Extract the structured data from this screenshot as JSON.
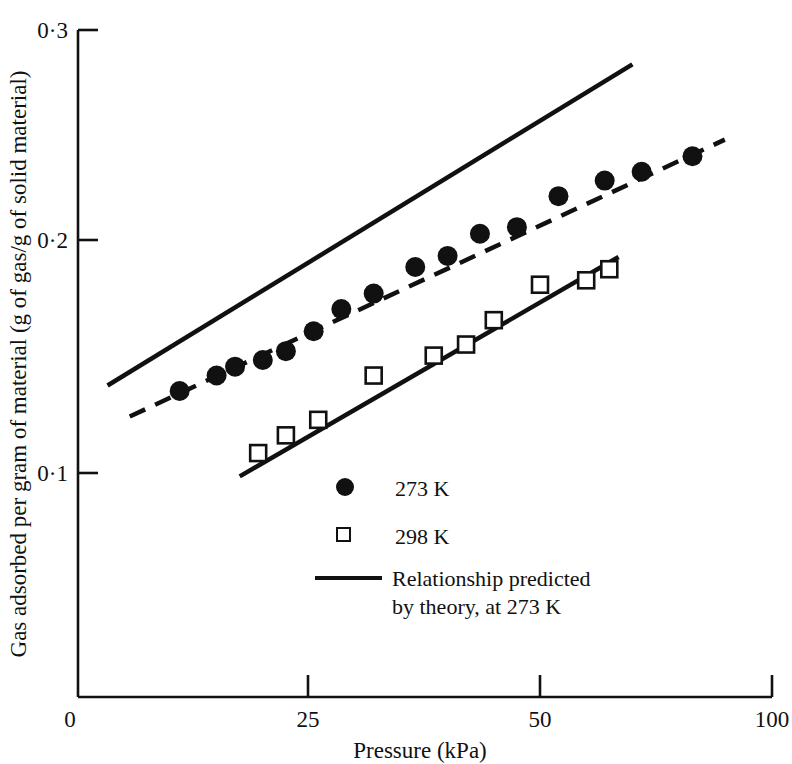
{
  "chart_data": {
    "type": "scatter",
    "title": "",
    "xlabel": "Pressure (kPa)",
    "ylabel": "Gas adsorbed per gram of material  (g of gas/g of solid material)",
    "xlim": [
      0,
      100
    ],
    "ylim": [
      0,
      0.3
    ],
    "xticks": [
      0,
      25,
      50,
      100
    ],
    "xtick_labels": [
      "0",
      "25",
      "50",
      "100"
    ],
    "yticks": [
      0.1,
      0.2,
      0.3
    ],
    "ytick_labels": [
      "0·1",
      "0·2",
      "0·3"
    ],
    "grid": false,
    "legend_position": "center",
    "note_axis": "x axis drawn with compressed final segment between 50 and 100",
    "series": [
      {
        "name": "273 K",
        "marker": "filled-circle",
        "line": "dashed",
        "color": "#111111",
        "points": [
          {
            "x": 11.0,
            "y": 0.137
          },
          {
            "x": 15.0,
            "y": 0.144
          },
          {
            "x": 17.0,
            "y": 0.148
          },
          {
            "x": 20.0,
            "y": 0.151
          },
          {
            "x": 22.5,
            "y": 0.155
          },
          {
            "x": 25.5,
            "y": 0.164
          },
          {
            "x": 28.5,
            "y": 0.174
          },
          {
            "x": 32.0,
            "y": 0.181
          },
          {
            "x": 36.5,
            "y": 0.193
          },
          {
            "x": 40.0,
            "y": 0.198
          },
          {
            "x": 43.5,
            "y": 0.208
          },
          {
            "x": 47.5,
            "y": 0.211
          },
          {
            "x": 52.0,
            "y": 0.225
          },
          {
            "x": 57.0,
            "y": 0.232
          },
          {
            "x": 61.0,
            "y": 0.236
          },
          {
            "x": 66.5,
            "y": 0.243
          }
        ]
      },
      {
        "name": "298 K",
        "marker": "open-square",
        "line": "solid",
        "color": "#111111",
        "points": [
          {
            "x": 19.5,
            "y": 0.109
          },
          {
            "x": 22.5,
            "y": 0.117
          },
          {
            "x": 26.0,
            "y": 0.124
          },
          {
            "x": 32.0,
            "y": 0.144
          },
          {
            "x": 38.5,
            "y": 0.153
          },
          {
            "x": 42.0,
            "y": 0.158
          },
          {
            "x": 45.0,
            "y": 0.169
          },
          {
            "x": 50.0,
            "y": 0.185
          },
          {
            "x": 55.0,
            "y": 0.187
          },
          {
            "x": 57.5,
            "y": 0.192
          }
        ]
      },
      {
        "name": "Relationship predicted by theory, at 273 K",
        "marker": "none",
        "line": "solid",
        "color": "#111111",
        "endpoints": [
          {
            "x": 3.2,
            "y": 0.1395
          },
          {
            "x": 60.0,
            "y": 0.2845
          }
        ]
      }
    ],
    "fit_lines": [
      {
        "series": "273 K",
        "style": "dashed",
        "endpoints": [
          {
            "x": 5.6,
            "y": 0.1255
          },
          {
            "x": 70.0,
            "y": 0.2505
          }
        ]
      },
      {
        "series": "298 K",
        "style": "solid",
        "endpoints": [
          {
            "x": 17.5,
            "y": 0.0985
          },
          {
            "x": 58.5,
            "y": 0.1975
          }
        ]
      }
    ]
  },
  "axes": {
    "y_title": "Gas adsorbed per gram of material  (g of gas/g of solid material)",
    "x_title": "Pressure (kPa)",
    "y_tick_labels": [
      "0·3",
      "0·2",
      "0·1"
    ],
    "x_tick_labels": [
      "0",
      "25",
      "50",
      "100"
    ],
    "origin_label": "0"
  },
  "legend": {
    "entries": [
      {
        "marker": "filled-circle",
        "label": "273 K"
      },
      {
        "marker": "open-square",
        "label": "298 K"
      },
      {
        "marker": "line",
        "label_line1": "Relationship predicted",
        "label_line2": "by theory, at 273 K"
      }
    ]
  },
  "colors": {
    "ink": "#111111",
    "background": "#ffffff"
  }
}
